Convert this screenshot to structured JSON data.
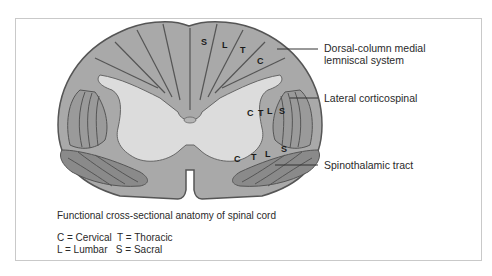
{
  "figure": {
    "caption": "Functional cross-sectional anatomy of spinal cord",
    "legend": {
      "line1": "C = Cervical  T = Thoracic",
      "line2": "L = Lumbar   S = Sacral"
    },
    "labels": {
      "dorsal_line1": "Dorsal-column medial",
      "dorsal_line2": "lemniscal system",
      "lateral": "Lateral corticospinal",
      "spinothalamic": "Spinothalamic tract"
    },
    "segments": {
      "dorsal": [
        "S",
        "L",
        "T",
        "C"
      ],
      "lateral": [
        "C",
        "T",
        "L",
        "S"
      ],
      "spinothalamic": [
        "C",
        "T",
        "L",
        "S"
      ]
    },
    "colors": {
      "white_matter": "#a9a9a9",
      "gray_matter": "#dcdcdc",
      "tract_dark": "#8a8a8a",
      "outline": "#555555"
    }
  }
}
